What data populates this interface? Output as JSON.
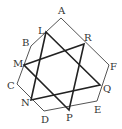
{
  "diagram": {
    "hexagon": {
      "vertices": [
        "A",
        "F",
        "E",
        "D",
        "C",
        "B"
      ]
    },
    "points": {
      "A": {
        "x": 61,
        "y": 18,
        "label": "A",
        "lx": 58,
        "ly": 14
      },
      "B": {
        "x": 31,
        "y": 46,
        "label": "B",
        "lx": 22,
        "ly": 46
      },
      "C": {
        "x": 17,
        "y": 84,
        "label": "C",
        "lx": 7,
        "ly": 89
      },
      "D": {
        "x": 44,
        "y": 111,
        "label": "D",
        "lx": 41,
        "ly": 123
      },
      "E": {
        "x": 97,
        "y": 101,
        "label": "E",
        "lx": 94,
        "ly": 113
      },
      "F": {
        "x": 109,
        "y": 65,
        "label": "F",
        "lx": 110,
        "ly": 70
      },
      "L": {
        "x": 46,
        "y": 32,
        "label": "L",
        "lx": 38,
        "ly": 34
      },
      "R": {
        "x": 84,
        "y": 44,
        "label": "R",
        "lx": 84,
        "ly": 41
      },
      "M": {
        "x": 24,
        "y": 65,
        "label": "M",
        "lx": 13,
        "ly": 67
      },
      "Q": {
        "x": 100,
        "y": 85,
        "label": "Q",
        "lx": 103,
        "ly": 92
      },
      "N": {
        "x": 31,
        "y": 100,
        "label": "N",
        "lx": 21,
        "ly": 106
      },
      "P": {
        "x": 69,
        "y": 110,
        "label": "P",
        "lx": 66,
        "ly": 121
      }
    },
    "triangles": [
      [
        "L",
        "N",
        "Q"
      ],
      [
        "M",
        "R",
        "P"
      ]
    ],
    "stroke_color": "#222222",
    "hexagon_color": "#555555"
  }
}
